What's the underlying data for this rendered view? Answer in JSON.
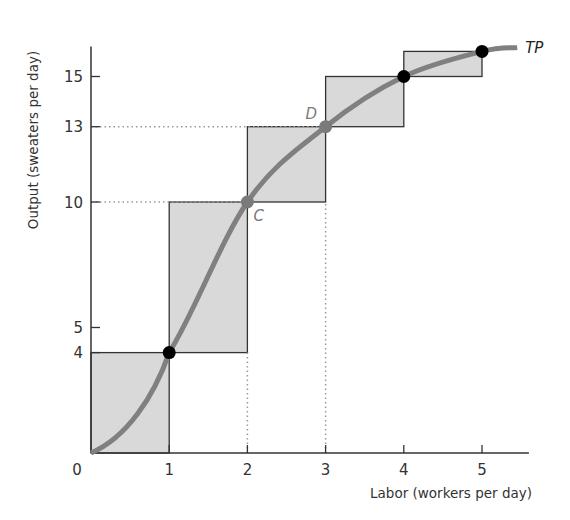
{
  "chart_data": {
    "type": "line",
    "title": "",
    "xlabel": "Labor (workers per day)",
    "ylabel": "Output (sweaters per day)",
    "xlim": [
      0,
      5.6
    ],
    "ylim": [
      0,
      16.2
    ],
    "x_ticks": [
      0,
      1,
      2,
      3,
      4,
      5
    ],
    "x_tick_labels": [
      "0",
      "1",
      "2",
      "3",
      "4",
      "5"
    ],
    "y_ticks": [
      4,
      5,
      10,
      13,
      15
    ],
    "y_tick_labels": [
      "4",
      "5",
      "10",
      "13",
      "15"
    ],
    "grid": false,
    "series": [
      {
        "name": "TP",
        "label": "TP",
        "x": [
          0,
          1,
          2,
          3,
          4,
          5
        ],
        "y": [
          0,
          4,
          10,
          13,
          15,
          16
        ],
        "color": "#808080"
      }
    ],
    "marginal_product_boxes": [
      {
        "x0": 0,
        "x1": 1,
        "y0": 0,
        "y1": 4
      },
      {
        "x0": 1,
        "x1": 2,
        "y0": 4,
        "y1": 10
      },
      {
        "x0": 2,
        "x1": 3,
        "y0": 10,
        "y1": 13
      },
      {
        "x0": 3,
        "x1": 4,
        "y0": 13,
        "y1": 15
      },
      {
        "x0": 4,
        "x1": 5,
        "y0": 15,
        "y1": 16
      }
    ],
    "points": [
      {
        "x": 1,
        "y": 4,
        "label": "",
        "color": "#000000"
      },
      {
        "x": 2,
        "y": 10,
        "label": "C",
        "color": "#7a7a7a"
      },
      {
        "x": 3,
        "y": 13,
        "label": "D",
        "color": "#7a7a7a"
      },
      {
        "x": 4,
        "y": 15,
        "label": "",
        "color": "#000000"
      },
      {
        "x": 5,
        "y": 16,
        "label": "",
        "color": "#000000"
      }
    ],
    "dotted_guides": [
      {
        "from": [
          0,
          10
        ],
        "to": [
          2,
          10
        ]
      },
      {
        "from": [
          0,
          13
        ],
        "to": [
          3,
          13
        ]
      },
      {
        "from": [
          2,
          0
        ],
        "to": [
          2,
          4
        ]
      },
      {
        "from": [
          3,
          0
        ],
        "to": [
          3,
          10
        ]
      }
    ],
    "annotations": [
      "C",
      "D",
      "TP"
    ]
  },
  "colors": {
    "box_fill": "#d9d9d9",
    "box_stroke": "#333333",
    "curve": "#808080",
    "axis": "#333333",
    "guide": "#999999"
  }
}
